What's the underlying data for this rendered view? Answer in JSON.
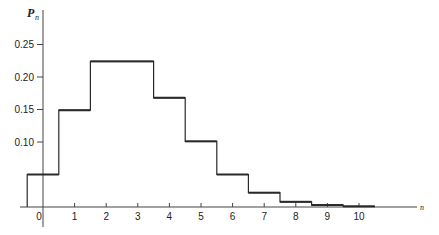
{
  "chart_data": {
    "type": "bar",
    "style": "step-histogram",
    "title": "",
    "xlabel": "n",
    "ylabel": "P_n",
    "ylabel_main": "P",
    "ylabel_sub": "n",
    "categories": [
      "0",
      "1",
      "2",
      "3",
      "4",
      "5",
      "6",
      "7",
      "8",
      "9",
      "10"
    ],
    "values": [
      0.05,
      0.149,
      0.224,
      0.224,
      0.168,
      0.101,
      0.05,
      0.022,
      0.008,
      0.003,
      0.001
    ],
    "yticks": [
      0.1,
      0.15,
      0.2,
      0.25
    ],
    "ytick_labels": [
      "0.10",
      "0.15",
      "0.20",
      "0.25"
    ],
    "xticks": [
      0,
      1,
      2,
      3,
      4,
      5,
      6,
      7,
      8,
      9,
      10
    ],
    "xtick_labels": [
      "0",
      "1",
      "2",
      "3",
      "4",
      "5",
      "6",
      "7",
      "8",
      "9",
      "10"
    ],
    "ylim": [
      0,
      0.3
    ],
    "xlim": [
      -0.6,
      11.8
    ],
    "grid": false,
    "legend": null
  },
  "colors": {
    "line": "#2a2a2a",
    "axis": "#444444",
    "background": "#ffffff"
  }
}
